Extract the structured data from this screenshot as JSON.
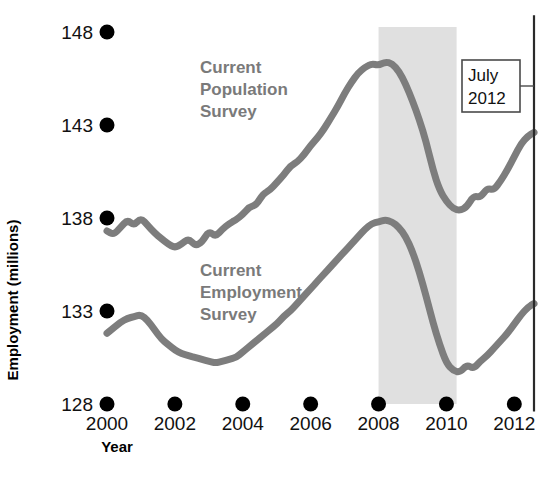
{
  "chart_data": {
    "type": "line",
    "title": "",
    "xlabel": "Year",
    "ylabel": "Employment (millions)",
    "xlim": [
      2000,
      2012.6
    ],
    "ylim": [
      128,
      148
    ],
    "grid": false,
    "legend_position": "inline-labels",
    "xticks": [
      2000,
      2002,
      2004,
      2006,
      2008,
      2010,
      2012
    ],
    "xtick_labels": [
      "2000",
      "2002",
      "2004",
      "2006",
      "2008",
      "2010",
      "2012"
    ],
    "yticks": [
      128,
      133,
      138,
      143,
      148
    ],
    "ytick_labels": [
      "128",
      "133",
      "138",
      "143",
      "148"
    ],
    "colors": {
      "series": "#7d7d7d",
      "recession_band": "#e0e0e0",
      "label_text": "#7a7a7a",
      "tick_text": "#111111",
      "axis_text": "#000000",
      "annotation_box_border": "#4a4a4a",
      "marker_line": "#2a2a2a"
    },
    "annotations": [
      {
        "name": "july-2012-callout",
        "lines": [
          "July",
          "2012"
        ],
        "box": {
          "x": 462,
          "y": 60,
          "width": 58,
          "height": 52
        },
        "leader_from": {
          "x": 520,
          "y": 86
        },
        "leader_to": {
          "x": 534,
          "y": 86
        }
      },
      {
        "name": "july-2012-marker-line",
        "type": "vertical-line",
        "x": 2012.58,
        "y_top": 148.9,
        "y_bottom": 127.6
      }
    ],
    "shaded_regions": [
      {
        "name": "recession-band",
        "x_start": 2008.0,
        "x_end": 2010.3,
        "label": ""
      }
    ],
    "series": [
      {
        "name": "Current Population Survey",
        "label_lines": [
          "Current",
          "Population",
          "Survey"
        ],
        "label_position": {
          "x": 200,
          "y": 73
        },
        "x": [
          2000.0,
          2000.2,
          2000.4,
          2000.6,
          2000.8,
          2001.0,
          2001.2,
          2001.4,
          2001.6,
          2001.8,
          2002.0,
          2002.2,
          2002.4,
          2002.6,
          2002.8,
          2003.0,
          2003.2,
          2003.4,
          2003.6,
          2003.8,
          2004.0,
          2004.2,
          2004.4,
          2004.6,
          2004.8,
          2005.0,
          2005.2,
          2005.4,
          2005.6,
          2005.8,
          2006.0,
          2006.2,
          2006.4,
          2006.6,
          2006.8,
          2007.0,
          2007.2,
          2007.4,
          2007.6,
          2007.8,
          2008.0,
          2008.2,
          2008.4,
          2008.6,
          2008.8,
          2009.0,
          2009.2,
          2009.4,
          2009.6,
          2009.8,
          2010.0,
          2010.2,
          2010.4,
          2010.6,
          2010.8,
          2011.0,
          2011.2,
          2011.4,
          2011.6,
          2011.8,
          2012.0,
          2012.2,
          2012.4,
          2012.58
        ],
        "values": [
          137.3,
          137.1,
          137.5,
          137.9,
          137.6,
          138.0,
          137.6,
          137.2,
          136.9,
          136.6,
          136.4,
          136.6,
          136.9,
          136.5,
          136.7,
          137.3,
          137.0,
          137.4,
          137.7,
          137.9,
          138.2,
          138.6,
          138.7,
          139.3,
          139.5,
          139.9,
          140.3,
          140.8,
          141.0,
          141.4,
          141.9,
          142.3,
          142.8,
          143.4,
          144.0,
          144.7,
          145.3,
          145.8,
          146.1,
          146.3,
          146.2,
          146.4,
          146.3,
          145.9,
          145.2,
          144.3,
          143.3,
          142.1,
          140.6,
          139.5,
          138.9,
          138.5,
          138.4,
          138.6,
          139.2,
          139.1,
          139.6,
          139.5,
          140.0,
          140.6,
          141.3,
          142.0,
          142.4,
          142.6
        ]
      },
      {
        "name": "Current Employment Survey",
        "label_lines": [
          "Current",
          "Employment",
          "Survey"
        ],
        "label_position": {
          "x": 200,
          "y": 276
        },
        "x": [
          2000.0,
          2000.2,
          2000.4,
          2000.6,
          2000.8,
          2001.0,
          2001.2,
          2001.4,
          2001.6,
          2001.8,
          2002.0,
          2002.2,
          2002.4,
          2002.6,
          2002.8,
          2003.0,
          2003.2,
          2003.4,
          2003.6,
          2003.8,
          2004.0,
          2004.2,
          2004.4,
          2004.6,
          2004.8,
          2005.0,
          2005.2,
          2005.4,
          2005.6,
          2005.8,
          2006.0,
          2006.2,
          2006.4,
          2006.6,
          2006.8,
          2007.0,
          2007.2,
          2007.4,
          2007.6,
          2007.8,
          2008.0,
          2008.2,
          2008.4,
          2008.6,
          2008.8,
          2009.0,
          2009.2,
          2009.4,
          2009.6,
          2009.8,
          2010.0,
          2010.2,
          2010.4,
          2010.6,
          2010.8,
          2011.0,
          2011.2,
          2011.4,
          2011.6,
          2011.8,
          2012.0,
          2012.2,
          2012.4,
          2012.58
        ],
        "values": [
          131.8,
          132.1,
          132.4,
          132.6,
          132.7,
          132.8,
          132.5,
          132.0,
          131.5,
          131.2,
          130.9,
          130.7,
          130.6,
          130.5,
          130.4,
          130.3,
          130.2,
          130.3,
          130.4,
          130.5,
          130.8,
          131.1,
          131.4,
          131.7,
          132.0,
          132.3,
          132.7,
          133.0,
          133.4,
          133.8,
          134.2,
          134.6,
          135.0,
          135.4,
          135.8,
          136.2,
          136.6,
          137.0,
          137.4,
          137.7,
          137.8,
          137.9,
          137.8,
          137.5,
          137.0,
          136.2,
          135.1,
          133.8,
          132.4,
          131.2,
          130.2,
          129.8,
          129.7,
          130.1,
          129.9,
          130.3,
          130.6,
          131.0,
          131.4,
          131.8,
          132.3,
          132.8,
          133.2,
          133.4
        ]
      }
    ]
  },
  "axis": {
    "y_title": "Employment (millions)",
    "x_title": "Year"
  }
}
